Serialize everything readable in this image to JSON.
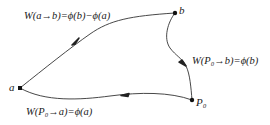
{
  "diagram": {
    "points": {
      "a": {
        "label": "a",
        "x": 20,
        "y": 88
      },
      "b": {
        "label": "b",
        "x": 175,
        "y": 13
      },
      "p0": {
        "label": "P₀",
        "x": 192,
        "y": 100
      }
    },
    "edges": [
      {
        "from": "a",
        "to": "b",
        "label": "W(a→b)=ϕ(b)−ϕ(a)"
      },
      {
        "from": "b",
        "to": "P0",
        "label": "W(P₀→b)=ϕ(b)"
      },
      {
        "from": "P0",
        "to": "a",
        "label": "W(P₀→a)=ϕ(a)"
      }
    ],
    "colors": {
      "line": "#333333",
      "point": "#111111",
      "text": "#1a1a1a"
    }
  }
}
